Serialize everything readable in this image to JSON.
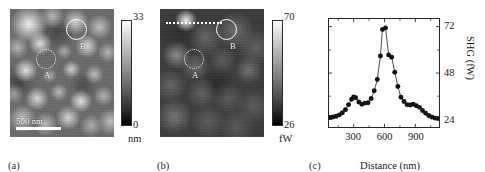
{
  "figure": {
    "panels": [
      {
        "id": "a",
        "label": "(a)",
        "kind": "afm-topography-image",
        "scalebar": "500 nm",
        "colorbar": {
          "max": "33",
          "min": "0",
          "unit": "nm"
        },
        "rois": [
          {
            "name": "A",
            "label": "A",
            "style": "dashed"
          },
          {
            "name": "B",
            "label": "B",
            "style": "solid"
          }
        ]
      },
      {
        "id": "b",
        "label": "(b)",
        "kind": "shg-intensity-image",
        "colorbar": {
          "max": "70",
          "min": "26",
          "unit": "fW"
        },
        "rois": [
          {
            "name": "A",
            "label": "A",
            "style": "dashed"
          },
          {
            "name": "B",
            "label": "B",
            "style": "solid"
          }
        ],
        "scanline": "dotted-line-scan-path"
      },
      {
        "id": "c",
        "label": "(c)",
        "kind": "line-scan-plot"
      }
    ]
  },
  "chart_data": {
    "type": "line",
    "title": "",
    "xlabel": "Distance (nm)",
    "ylabel": "SHG (fW)",
    "xlim": [
      60,
      1130
    ],
    "ylim": [
      20,
      76
    ],
    "xticks": [
      300,
      600,
      900
    ],
    "xtick_labels": [
      "300",
      "600",
      "900"
    ],
    "yticks": [
      24,
      48,
      72
    ],
    "ytick_labels": [
      "24",
      "48",
      "72"
    ],
    "y_axis_side": "right",
    "grid": false,
    "legend": false,
    "marker": "filled-circle",
    "series": [
      {
        "name": "SHG line scan",
        "x": [
          70,
          100,
          130,
          160,
          190,
          220,
          250,
          280,
          300,
          320,
          350,
          380,
          410,
          440,
          470,
          500,
          530,
          560,
          580,
          610,
          640,
          670,
          700,
          730,
          760,
          790,
          820,
          850,
          880,
          910,
          940,
          970,
          1000,
          1030,
          1060,
          1090,
          1120
        ],
        "y": [
          25.0,
          25.2,
          25.6,
          26.3,
          27.4,
          29.0,
          31.6,
          34.4,
          35.6,
          35.2,
          33.0,
          31.8,
          32.4,
          32.6,
          34.8,
          38.8,
          44.6,
          56.8,
          70.6,
          71.4,
          57.4,
          56.2,
          48.4,
          41.0,
          35.4,
          33.2,
          31.6,
          31.4,
          31.8,
          31.0,
          30.2,
          28.6,
          27.2,
          26.0,
          25.2,
          24.6,
          24.4
        ]
      }
    ]
  }
}
